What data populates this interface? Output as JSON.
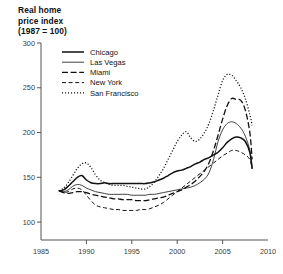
{
  "title": {
    "line1": "Real home",
    "line2": "price index",
    "line3": "(1987 = 100)"
  },
  "chart_data": {
    "type": "line",
    "title": "Real home price index (1987 = 100)",
    "xlabel": "",
    "ylabel": "",
    "xlim": [
      1985,
      2010
    ],
    "ylim": [
      80,
      300
    ],
    "xticks": [
      "1985",
      "1990",
      "1995",
      "2000",
      "2005",
      "2010"
    ],
    "yticks": [
      "100",
      "150",
      "200",
      "250",
      "300"
    ],
    "grid": false,
    "legend_position": "top-left-inside",
    "x": [
      1987,
      1987.5,
      1988,
      1988.5,
      1989,
      1989.5,
      1990,
      1990.5,
      1991,
      1991.5,
      1992,
      1992.5,
      1993,
      1993.5,
      1994,
      1994.5,
      1995,
      1995.5,
      1996,
      1996.5,
      1997,
      1997.5,
      1998,
      1998.5,
      1999,
      1999.5,
      2000,
      2000.5,
      2001,
      2001.5,
      2002,
      2002.5,
      2003,
      2003.5,
      2004,
      2004.5,
      2005,
      2005.5,
      2006,
      2006.5,
      2007,
      2007.5,
      2008,
      2008.25
    ],
    "series": [
      {
        "name": "Chicago",
        "style": "solid-thick",
        "values": [
          135,
          136,
          140,
          145,
          150,
          152,
          147,
          144,
          143,
          143,
          144,
          143,
          143,
          143,
          143,
          143,
          143,
          143,
          143,
          143,
          144,
          145,
          147,
          149,
          152,
          155,
          157,
          158,
          160,
          162,
          165,
          167,
          170,
          172,
          175,
          178,
          183,
          189,
          193,
          195,
          194,
          190,
          178,
          160
        ]
      },
      {
        "name": "Las Vegas",
        "style": "solid-thin",
        "values": [
          135,
          134,
          136,
          140,
          142,
          141,
          138,
          136,
          134,
          133,
          132,
          131,
          131,
          131,
          131,
          131,
          130,
          130,
          130,
          130,
          131,
          131,
          132,
          133,
          134,
          135,
          136,
          137,
          138,
          139,
          141,
          144,
          148,
          155,
          170,
          190,
          203,
          210,
          212,
          210,
          205,
          196,
          180,
          160
        ]
      },
      {
        "name": "Miami",
        "style": "dash-long",
        "values": [
          135,
          133,
          132,
          133,
          134,
          134,
          133,
          131,
          130,
          129,
          128,
          127,
          126,
          126,
          125,
          125,
          125,
          124,
          124,
          124,
          125,
          126,
          127,
          128,
          130,
          132,
          134,
          136,
          139,
          142,
          146,
          151,
          157,
          166,
          180,
          197,
          215,
          230,
          238,
          237,
          236,
          225,
          200,
          170
        ]
      },
      {
        "name": "New York",
        "style": "dash-short",
        "values": [
          135,
          133,
          134,
          137,
          138,
          136,
          130,
          124,
          119,
          117,
          116,
          115,
          114,
          114,
          113,
          113,
          113,
          113,
          114,
          114,
          115,
          117,
          119,
          122,
          126,
          130,
          134,
          138,
          142,
          146,
          150,
          154,
          158,
          162,
          166,
          170,
          174,
          177,
          180,
          180,
          178,
          175,
          170,
          160
        ]
      },
      {
        "name": "San Francisco",
        "style": "dotted",
        "values": [
          135,
          138,
          144,
          152,
          160,
          165,
          166,
          161,
          153,
          147,
          144,
          142,
          141,
          141,
          141,
          140,
          139,
          138,
          137,
          137,
          140,
          145,
          152,
          160,
          170,
          180,
          190,
          197,
          201,
          194,
          190,
          193,
          200,
          210,
          225,
          242,
          258,
          265,
          264,
          258,
          250,
          238,
          220,
          208
        ]
      }
    ]
  },
  "legend": [
    {
      "label": "Chicago",
      "style": "solid-thick"
    },
    {
      "label": "Las Vegas",
      "style": "solid-thin"
    },
    {
      "label": "Miami",
      "style": "dash-long"
    },
    {
      "label": "New York",
      "style": "dash-short"
    },
    {
      "label": "San Francisco",
      "style": "dotted"
    }
  ]
}
